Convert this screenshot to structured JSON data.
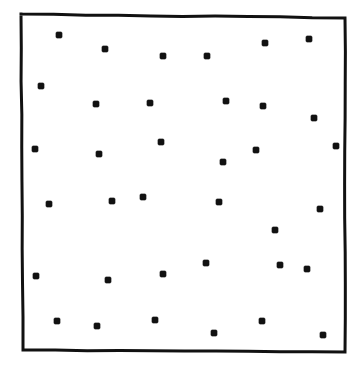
{
  "figure": {
    "title": "",
    "caption": "",
    "background_color": "#ffffff",
    "ink_color": "#111111"
  },
  "frame": {
    "name": "plot-border",
    "style": "hand-drawn rectangle, solid black outline",
    "stroke_color": "#111111",
    "stroke_width": 3,
    "corners": {
      "top_left": [
        21,
        14
      ],
      "top_right": [
        345,
        18
      ],
      "bottom_right": [
        345,
        352
      ],
      "bottom_left": [
        23,
        350
      ]
    }
  },
  "chart_data": {
    "type": "scatter",
    "title": "",
    "subtitle": "",
    "xlabel": "",
    "ylabel": "",
    "xlim": [
      21,
      345
    ],
    "ylim": [
      14,
      352
    ],
    "grid": false,
    "legend": null,
    "axis_ticks": {
      "x": [],
      "y": []
    },
    "annotations": [],
    "marker": {
      "shape": "square",
      "size_px": 6,
      "fill_color": "#111111",
      "edge_color": "#111111"
    },
    "n_points": 36,
    "series": [
      {
        "name": "points",
        "color": "#111111",
        "points": [
          [
            59,
            35
          ],
          [
            105,
            49
          ],
          [
            163,
            56
          ],
          [
            207,
            56
          ],
          [
            265,
            43
          ],
          [
            309,
            39
          ],
          [
            41,
            86
          ],
          [
            96,
            104
          ],
          [
            150,
            103
          ],
          [
            226,
            101
          ],
          [
            263,
            106
          ],
          [
            314,
            118
          ],
          [
            35,
            149
          ],
          [
            99,
            154
          ],
          [
            161,
            142
          ],
          [
            223,
            162
          ],
          [
            256,
            150
          ],
          [
            336,
            146
          ],
          [
            49,
            204
          ],
          [
            112,
            201
          ],
          [
            143,
            197
          ],
          [
            219,
            202
          ],
          [
            275,
            230
          ],
          [
            320,
            209
          ],
          [
            36,
            276
          ],
          [
            108,
            280
          ],
          [
            163,
            274
          ],
          [
            206,
            263
          ],
          [
            280,
            265
          ],
          [
            307,
            269
          ],
          [
            57,
            321
          ],
          [
            97,
            326
          ],
          [
            155,
            320
          ],
          [
            214,
            333
          ],
          [
            262,
            321
          ],
          [
            323,
            335
          ]
        ]
      }
    ]
  }
}
